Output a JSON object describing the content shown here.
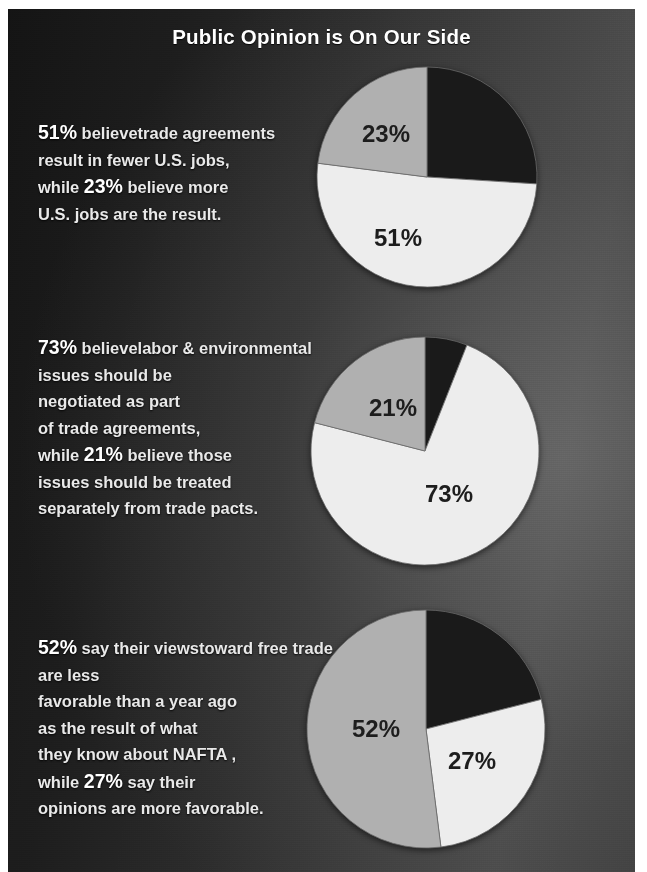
{
  "poster": {
    "title": "Public Opinion is On Our Side",
    "background_dark": "#1d1d1d",
    "background_light": "#4a4a4a",
    "text_color": "#e9e9e9"
  },
  "palette": {
    "slice_dark": "#1a1a1a",
    "slice_white": "#ededed",
    "slice_gray": "#b0b0b0",
    "label_text": "#1d1d1d"
  },
  "blurbs": [
    {
      "lead_pct": "51%",
      "lead_tail": " believe",
      "body": "trade agreements\nresult in fewer U.S. jobs,\nwhile ",
      "mid_pct": "23%",
      "tail": " believe more\nU.S. jobs are the result."
    },
    {
      "lead_pct": "73%",
      "lead_tail": " believe",
      "body": "labor & environmental\nissues should be\nnegotiated as part\nof trade agreements,\nwhile ",
      "mid_pct": "21%",
      "tail": "  believe those\nissues should be treated\nseparately from trade pacts."
    },
    {
      "lead_pct": "52%",
      "lead_tail": " say their views",
      "body": "toward free trade are less\nfavorable than a year ago\nas the result of what\nthey know about NAFTA ,\nwhile ",
      "mid_pct": "27%",
      "tail": " say their\nopinions are more favorable."
    }
  ],
  "chart_data": [
    {
      "type": "pie",
      "title": "Trade agreements and U.S. jobs",
      "labels": [
        "fewer U.S. jobs",
        "more U.S. jobs",
        "other / no opinion"
      ],
      "values": [
        51,
        23,
        26
      ],
      "colors": [
        "#ededed",
        "#b0b0b0",
        "#1a1a1a"
      ],
      "visible_labels": [
        "51%",
        "23%"
      ],
      "start_angle_deg": 0,
      "direction": "clockwise",
      "slice_order": [
        "other / no opinion",
        "fewer U.S. jobs",
        "more U.S. jobs"
      ],
      "legend": "none"
    },
    {
      "type": "pie",
      "title": "Labor & environmental issues in trade agreements",
      "labels": [
        "negotiated as part of trade agreements",
        "treated separately",
        "other / no opinion"
      ],
      "values": [
        73,
        21,
        6
      ],
      "colors": [
        "#ededed",
        "#b0b0b0",
        "#1a1a1a"
      ],
      "visible_labels": [
        "73%",
        "21%"
      ],
      "start_angle_deg": 0,
      "direction": "clockwise",
      "slice_order": [
        "other / no opinion",
        "negotiated as part of trade agreements",
        "treated separately"
      ],
      "legend": "none"
    },
    {
      "type": "pie",
      "title": "Views toward free trade after NAFTA",
      "labels": [
        "less favorable",
        "more favorable",
        "other / no opinion"
      ],
      "values": [
        52,
        27,
        21
      ],
      "colors": [
        "#b0b0b0",
        "#ededed",
        "#1a1a1a"
      ],
      "visible_labels": [
        "52%",
        "27%"
      ],
      "start_angle_deg": 0,
      "direction": "clockwise",
      "slice_order": [
        "other / no opinion",
        "more favorable",
        "less favorable"
      ],
      "legend": "none"
    }
  ],
  "pie_labels": {
    "p1_white": "51%",
    "p1_gray": "23%",
    "p2_white": "73%",
    "p2_gray": "21%",
    "p3_gray": "52%",
    "p3_white": "27%"
  }
}
